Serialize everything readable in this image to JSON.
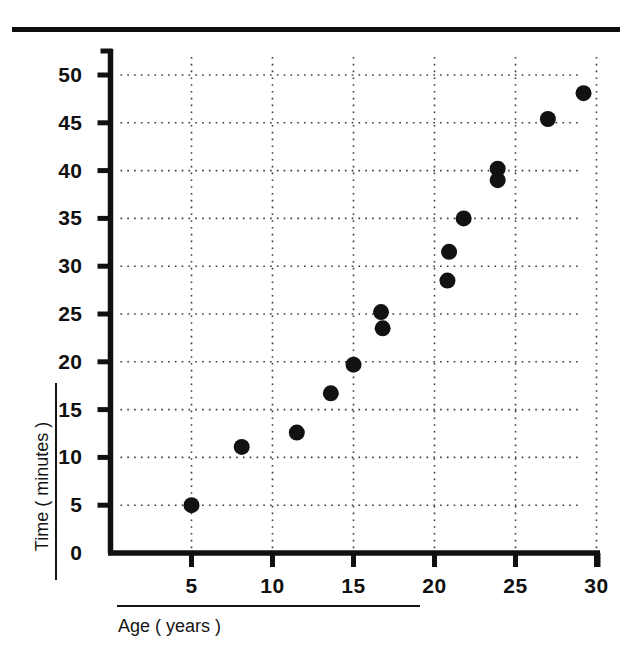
{
  "figure": {
    "background_color": "#ffffff",
    "ink_color": "#101010",
    "top_rule": true
  },
  "chart_data": {
    "type": "scatter",
    "title": "",
    "subtitle": "",
    "xlabel": "Age ( years )",
    "ylabel": "Time ( minutes )",
    "xlim": [
      0,
      32.5
    ],
    "ylim": [
      0,
      52.5
    ],
    "xticks": [
      5,
      10,
      15,
      20,
      25,
      30
    ],
    "yticks": [
      0,
      5,
      10,
      15,
      20,
      25,
      30,
      35,
      40,
      45,
      50
    ],
    "xtick_labels": [
      "5",
      "10",
      "15",
      "20",
      "25",
      "30"
    ],
    "ytick_labels": [
      "0",
      "5",
      "10",
      "15",
      "20",
      "25",
      "30",
      "35",
      "40",
      "45",
      "50"
    ],
    "grid": true,
    "grid_style": "dotted",
    "grid_color": "#3a3a3a",
    "legend": false,
    "legend_position": "none",
    "marker": "filled-circle",
    "marker_color": "#121212",
    "marker_size_px": 16,
    "x": [
      5.0,
      8.1,
      11.5,
      13.6,
      15.0,
      16.7,
      16.8,
      20.8,
      20.9,
      21.8,
      23.9,
      23.9,
      27.0,
      29.2
    ],
    "y": [
      5.0,
      11.1,
      12.6,
      16.7,
      19.7,
      25.2,
      23.5,
      28.5,
      31.5,
      35.0,
      40.2,
      39.0,
      45.4,
      48.1
    ],
    "points": [
      {
        "x": 5.0,
        "y": 5.0
      },
      {
        "x": 8.1,
        "y": 11.1
      },
      {
        "x": 11.5,
        "y": 12.6
      },
      {
        "x": 13.6,
        "y": 16.7
      },
      {
        "x": 15.0,
        "y": 19.7
      },
      {
        "x": 16.7,
        "y": 25.2
      },
      {
        "x": 16.8,
        "y": 23.5
      },
      {
        "x": 20.8,
        "y": 28.5
      },
      {
        "x": 20.9,
        "y": 31.5
      },
      {
        "x": 21.8,
        "y": 35.0
      },
      {
        "x": 23.9,
        "y": 40.2
      },
      {
        "x": 23.9,
        "y": 39.0
      },
      {
        "x": 27.0,
        "y": 45.4
      },
      {
        "x": 29.2,
        "y": 48.1
      }
    ]
  }
}
